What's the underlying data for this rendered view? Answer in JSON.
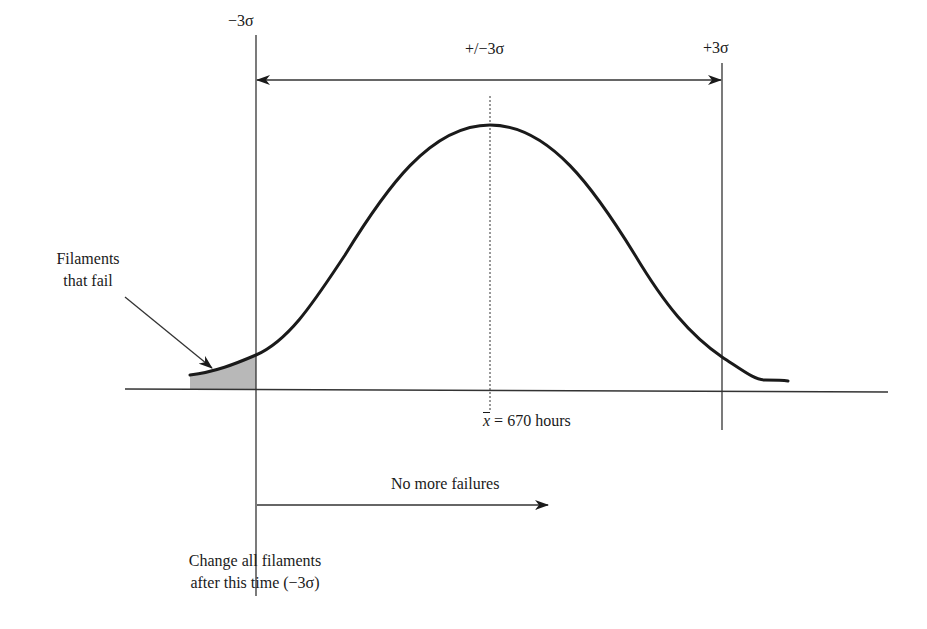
{
  "diagram": {
    "type": "normal-distribution",
    "labels": {
      "minus_3_sigma": "−3σ",
      "plus_minus_3_sigma": "+/−3σ",
      "plus_3_sigma": "+3σ",
      "filaments_fail_line1": "Filaments",
      "filaments_fail_line2": "that fail",
      "mean_symbol": "x",
      "mean_value": " = 670 hours",
      "no_more_failures": "No more failures",
      "change_line1": "Change all filaments",
      "change_line2": "after this time (−3σ)"
    },
    "mean_hours": 670,
    "shaded_region": "left tail below −3σ",
    "colors": {
      "line": "#1a1a1a",
      "shade": "#b8b8b8",
      "background": "#ffffff"
    }
  }
}
